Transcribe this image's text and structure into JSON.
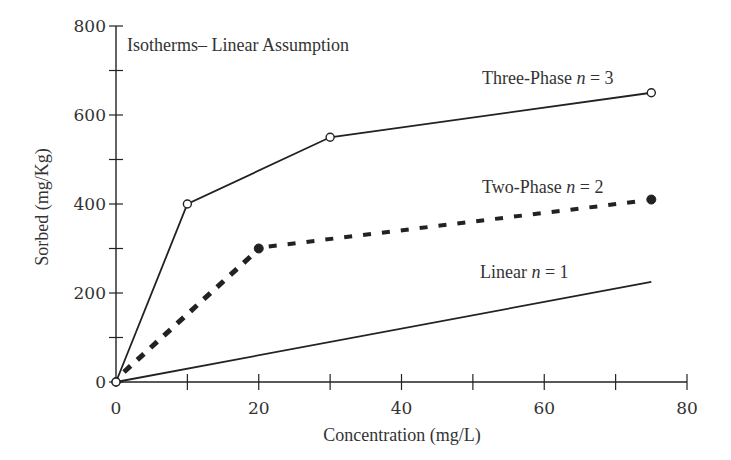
{
  "chart_data": {
    "type": "line",
    "title": "Isotherms– Linear Assumption",
    "xlabel": "Concentration (mg/L)",
    "ylabel": "Sorbed (mg/Kg)",
    "xlim": [
      0,
      80
    ],
    "ylim": [
      0,
      800
    ],
    "x_ticks": [
      0,
      20,
      40,
      60,
      80
    ],
    "y_ticks": [
      0,
      200,
      400,
      600,
      800
    ],
    "x_minor_ticks": [
      10,
      30,
      50,
      70
    ],
    "y_minor_ticks": [
      100,
      300,
      500,
      700
    ],
    "grid": false,
    "legend": "inline labels near line ends",
    "series": [
      {
        "name": "Three-Phase n = 3",
        "label_text": "Three-Phase ",
        "label_var": "n",
        "label_eq": " = 3",
        "style": "solid",
        "marker": "open-circle",
        "x": [
          0,
          10,
          30,
          75
        ],
        "y": [
          0,
          400,
          550,
          650
        ]
      },
      {
        "name": "Two-Phase n = 2",
        "label_text": "Two-Phase ",
        "label_var": "n",
        "label_eq": " = 2",
        "style": "dashed",
        "marker": "filled-circle",
        "x": [
          0,
          20,
          75
        ],
        "y": [
          0,
          300,
          410
        ]
      },
      {
        "name": "Linear n = 1",
        "label_text": "Linear ",
        "label_var": "n",
        "label_eq": " = 1",
        "style": "solid",
        "marker": "none",
        "x": [
          0,
          75
        ],
        "y": [
          0,
          225
        ]
      }
    ]
  }
}
